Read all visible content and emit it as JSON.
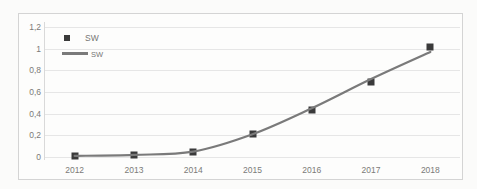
{
  "chart_data": {
    "type": "scatter",
    "title": "",
    "xlabel": "",
    "ylabel": "",
    "x": [
      2012,
      2013,
      2014,
      2015,
      2016,
      2017,
      2018
    ],
    "categories": [
      "2012",
      "2013",
      "2014",
      "2015",
      "2016",
      "2017",
      "2018"
    ],
    "series": [
      {
        "name": "SW",
        "kind": "markers",
        "marker": "square",
        "color": "#3a3a3a",
        "values": [
          0.01,
          0.02,
          0.05,
          0.21,
          0.43,
          0.69,
          1.02
        ]
      },
      {
        "name": "SW",
        "kind": "line",
        "color": "#7a7a7a",
        "values": [
          0.01,
          0.02,
          0.05,
          0.21,
          0.45,
          0.72,
          0.97
        ]
      }
    ],
    "ylim": [
      0,
      1.2
    ],
    "ytick_values": [
      0,
      0.2,
      0.4,
      0.6,
      0.8,
      1.0,
      1.2
    ],
    "ytick_labels": [
      "0",
      "0,2",
      "0,4",
      "0,6",
      "0,8",
      "1",
      "1,2"
    ],
    "xtick_labels": [
      "2012",
      "2013",
      "2014",
      "2015",
      "2016",
      "2017",
      "2018"
    ],
    "grid": true,
    "grid_axis": "y",
    "legend_position": "top-left",
    "legend_entries": [
      {
        "label": "SW",
        "type": "marker"
      },
      {
        "label": "SW",
        "type": "line"
      }
    ]
  },
  "colors": {
    "marker": "#3a3a3a",
    "line": "#7a7a7a",
    "gridline": "#e6e6e6",
    "axis": "#d9d9d9",
    "tick_text": "#7b7b78",
    "frame": "#d4d4d4",
    "background": "#fbfbfa"
  }
}
